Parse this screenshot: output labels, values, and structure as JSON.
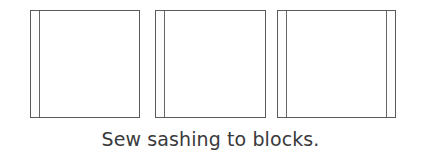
{
  "figure": {
    "canvas": {
      "width": 421,
      "height": 158,
      "background_color": "#ffffff"
    },
    "caption": "Sew sashing to blocks.",
    "caption_color": "#3a3a3c",
    "outline_color": "#5a5a5e",
    "sashing_line_color": "#67676b",
    "sashing_fill_color": "#fdfdfd",
    "block_fill_color": "#ffffff"
  },
  "diagram": {
    "type": "quilt-blocks-with-sashing",
    "block_count": 3,
    "blocks": [
      {
        "index": 1,
        "label": "block-1",
        "x": 30,
        "y": 10,
        "width": 110,
        "height": 108,
        "sashing": [
          "left"
        ],
        "sashing_width": 9
      },
      {
        "index": 2,
        "label": "block-2",
        "x": 155,
        "y": 10,
        "width": 111,
        "height": 108,
        "sashing": [
          "left"
        ],
        "sashing_width": 9
      },
      {
        "index": 3,
        "label": "block-3",
        "x": 277,
        "y": 10,
        "width": 119,
        "height": 108,
        "sashing": [
          "left",
          "right"
        ],
        "sashing_width": 9
      }
    ]
  }
}
